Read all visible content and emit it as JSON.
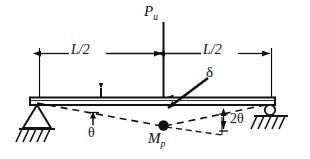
{
  "figure": {
    "background_color": "#ffffff",
    "line_color": "#111111"
  },
  "labels": {
    "load": {
      "symbol": "P",
      "subscript": "u",
      "text": "Pu"
    },
    "span_left": "L/2",
    "span_right": "L/2",
    "deflection": "δ",
    "plastic_moment": {
      "symbol": "M",
      "subscript": "p",
      "text": "Mp"
    },
    "rotation": "θ",
    "rotation_double": "2θ"
  },
  "elements": {
    "beam": "beam",
    "load_arrow": "downward-point-load-arrow",
    "left_support": "pinned-support",
    "right_support": "roller-support",
    "plastic_hinge": "plastic-hinge-dot",
    "collapse_mechanism": "dashed-deflected-shape",
    "dimension_line_left": "L/2 dimension with arrowheads",
    "dimension_line_right": "L/2 dimension with arrowheads",
    "delta_leader": "delta-leader-arrow",
    "angle_marker_2theta": "double-headed-vertical-arrow"
  }
}
